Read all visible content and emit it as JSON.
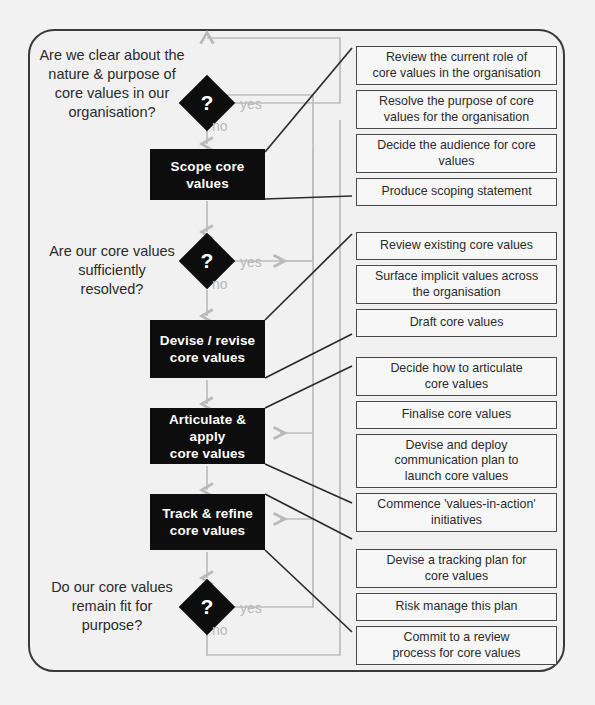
{
  "diagram": {
    "type": "flowchart",
    "colors": {
      "process_fill": "#0d0d0d",
      "process_text": "#ffffff",
      "task_border": "#4a4a4a",
      "task_fill": "#f7f7f7",
      "loop_line": "#bdbdbd",
      "connector_line": "#2b2b2b",
      "frame_border": "#3a3a3a",
      "page_background": "#f1f1f1"
    }
  },
  "questions": [
    {
      "id": "q1",
      "text": "Are we clear about the\nnature & purpose of\ncore values in our\norganisation?"
    },
    {
      "id": "q2",
      "text": "Are our core values\nsufficiently\nresolved?"
    },
    {
      "id": "q3",
      "text": "Do our core values\nremain fit for\npurpose?"
    }
  ],
  "decisions": [
    {
      "id": "d1",
      "mark": "?",
      "yes_label": "yes",
      "no_label": "no"
    },
    {
      "id": "d2",
      "mark": "?",
      "yes_label": "yes",
      "no_label": "no"
    },
    {
      "id": "d3",
      "mark": "?",
      "yes_label": "yes",
      "no_label": "no"
    }
  ],
  "processes": [
    {
      "id": "p1",
      "text": "Scope core\nvalues"
    },
    {
      "id": "p2",
      "text": "Devise / revise\ncore values"
    },
    {
      "id": "p3",
      "text": "Articulate & apply\ncore values"
    },
    {
      "id": "p4",
      "text": "Track & refine\ncore values"
    }
  ],
  "task_groups": [
    {
      "id": "g1",
      "parent": "p1",
      "tasks": [
        "Review the current role of\ncore values in the organisation",
        "Resolve the purpose of core\nvalues for the organisation",
        "Decide the audience for core\nvalues",
        "Produce scoping statement"
      ]
    },
    {
      "id": "g2",
      "parent": "p2",
      "tasks": [
        "Review existing core values",
        "Surface implicit values across\nthe organisation",
        "Draft core values"
      ]
    },
    {
      "id": "g3",
      "parent": "p3",
      "tasks": [
        "Decide how to articulate\ncore values",
        "Finalise core values",
        "Devise and deploy\ncommunication plan to\nlaunch core values",
        "Commence 'values-in-action'\ninitiatives"
      ]
    },
    {
      "id": "g4",
      "parent": "p4",
      "tasks": [
        "Devise a tracking plan for\ncore values",
        "Risk manage this plan",
        "Commit to a review\nprocess for core values"
      ]
    }
  ]
}
